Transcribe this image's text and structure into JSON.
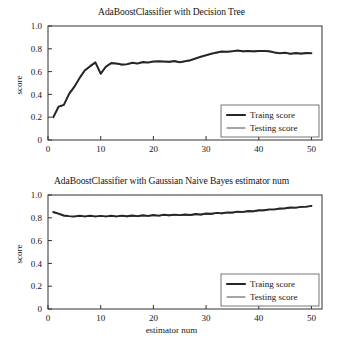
{
  "figure": {
    "background": "#ffffff",
    "line_color_train": "#262626",
    "line_color_test": "#4d4d4d"
  },
  "chart_data": [
    {
      "id": "decision-tree",
      "type": "line",
      "title": "AdaBoostClassifier with Decision Tree",
      "xlabel": "",
      "ylabel": "score",
      "xlim": [
        0,
        52
      ],
      "ylim": [
        0,
        1.0
      ],
      "xticks": [
        0,
        10,
        20,
        30,
        40,
        50
      ],
      "xtick_labels": [
        "0",
        "10",
        "20",
        "30",
        "40",
        "50"
      ],
      "yticks": [
        0,
        0.2,
        0.4,
        0.6,
        0.8,
        1.0
      ],
      "ytick_labels": [
        "0",
        "0.2",
        "0.4",
        "0.6",
        "0.8",
        "1.0"
      ],
      "grid": false,
      "legend_position": "lower right",
      "legend": [
        "Traing score",
        "Testing score"
      ],
      "x": [
        1,
        2,
        3,
        4,
        5,
        6,
        7,
        8,
        9,
        10,
        11,
        12,
        13,
        14,
        15,
        16,
        17,
        18,
        19,
        20,
        21,
        22,
        23,
        24,
        25,
        26,
        27,
        28,
        29,
        30,
        31,
        32,
        33,
        34,
        35,
        36,
        37,
        38,
        39,
        40,
        41,
        42,
        43,
        44,
        45,
        46,
        47,
        48,
        49,
        50
      ],
      "series": [
        {
          "name": "Traing score",
          "color": "#262626",
          "values": [
            0.2,
            0.292,
            0.308,
            0.405,
            0.468,
            0.545,
            0.612,
            0.648,
            0.681,
            0.582,
            0.645,
            0.676,
            0.672,
            0.662,
            0.666,
            0.678,
            0.672,
            0.684,
            0.681,
            0.69,
            0.692,
            0.69,
            0.686,
            0.693,
            0.683,
            0.692,
            0.7,
            0.716,
            0.731,
            0.744,
            0.757,
            0.768,
            0.776,
            0.775,
            0.78,
            0.786,
            0.779,
            0.782,
            0.778,
            0.781,
            0.782,
            0.779,
            0.769,
            0.762,
            0.766,
            0.758,
            0.763,
            0.759,
            0.763,
            0.762
          ]
        },
        {
          "name": "Testing score",
          "color": "#4d4d4d",
          "values": [
            0.197,
            0.289,
            0.305,
            0.401,
            0.464,
            0.541,
            0.608,
            0.644,
            0.677,
            0.578,
            0.641,
            0.672,
            0.668,
            0.658,
            0.662,
            0.674,
            0.668,
            0.68,
            0.677,
            0.686,
            0.688,
            0.686,
            0.682,
            0.689,
            0.679,
            0.688,
            0.696,
            0.712,
            0.727,
            0.74,
            0.753,
            0.764,
            0.772,
            0.771,
            0.776,
            0.782,
            0.775,
            0.778,
            0.774,
            0.777,
            0.778,
            0.775,
            0.765,
            0.758,
            0.762,
            0.754,
            0.759,
            0.755,
            0.759,
            0.758
          ]
        }
      ]
    },
    {
      "id": "gaussian-naive-bayes",
      "type": "line",
      "title": "AdaBoostClassifier with Gaussian Naive Bayes estimator num",
      "xlabel": "estimator num",
      "ylabel": "score",
      "xlim": [
        0,
        52
      ],
      "ylim": [
        0,
        1.0
      ],
      "xticks": [
        0,
        10,
        20,
        30,
        40,
        50
      ],
      "xtick_labels": [
        "0",
        "10",
        "20",
        "30",
        "40",
        "50"
      ],
      "yticks": [
        0,
        0.2,
        0.4,
        0.6,
        0.8,
        1.0
      ],
      "ytick_labels": [
        "0",
        "0.2",
        "0.4",
        "0.6",
        "0.8",
        "1.0"
      ],
      "grid": false,
      "legend_position": "lower right",
      "legend": [
        "Traing score",
        "Testing score"
      ],
      "x": [
        1,
        2,
        3,
        4,
        5,
        6,
        7,
        8,
        9,
        10,
        11,
        12,
        13,
        14,
        15,
        16,
        17,
        18,
        19,
        20,
        21,
        22,
        23,
        24,
        25,
        26,
        27,
        28,
        29,
        30,
        31,
        32,
        33,
        34,
        35,
        36,
        37,
        38,
        39,
        40,
        41,
        42,
        43,
        44,
        45,
        46,
        47,
        48,
        49,
        50
      ],
      "series": [
        {
          "name": "Traing score",
          "color": "#262626",
          "values": [
            0.851,
            0.836,
            0.82,
            0.815,
            0.812,
            0.818,
            0.812,
            0.818,
            0.812,
            0.817,
            0.812,
            0.818,
            0.813,
            0.819,
            0.814,
            0.82,
            0.815,
            0.822,
            0.817,
            0.824,
            0.819,
            0.827,
            0.822,
            0.828,
            0.823,
            0.829,
            0.825,
            0.833,
            0.829,
            0.838,
            0.835,
            0.843,
            0.84,
            0.848,
            0.846,
            0.854,
            0.852,
            0.86,
            0.858,
            0.866,
            0.866,
            0.874,
            0.874,
            0.882,
            0.884,
            0.89,
            0.889,
            0.896,
            0.898,
            0.905
          ]
        },
        {
          "name": "Testing score",
          "color": "#4d4d4d",
          "values": [
            0.848,
            0.833,
            0.817,
            0.812,
            0.809,
            0.815,
            0.809,
            0.815,
            0.809,
            0.814,
            0.809,
            0.815,
            0.81,
            0.816,
            0.811,
            0.817,
            0.812,
            0.819,
            0.814,
            0.821,
            0.816,
            0.824,
            0.819,
            0.825,
            0.82,
            0.826,
            0.822,
            0.83,
            0.826,
            0.835,
            0.832,
            0.84,
            0.837,
            0.845,
            0.843,
            0.851,
            0.849,
            0.857,
            0.855,
            0.863,
            0.863,
            0.871,
            0.871,
            0.879,
            0.881,
            0.887,
            0.886,
            0.893,
            0.895,
            0.902
          ]
        }
      ]
    }
  ]
}
